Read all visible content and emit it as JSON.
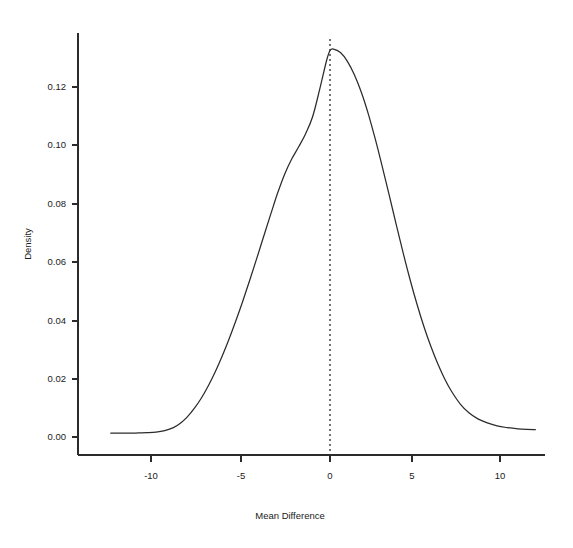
{
  "chart_data": {
    "type": "line",
    "title": "",
    "subtitle": "",
    "xlabel": "Mean Difference",
    "ylabel": "Density",
    "xlim": [
      -12.6,
      11.8
    ],
    "ylim": [
      0.0,
      0.138
    ],
    "grid": false,
    "legend": "none",
    "annotations": [
      {
        "kind": "vertical-reference-line",
        "style": "dotted",
        "x": 0,
        "label": ""
      }
    ],
    "xticks": [
      -10,
      -5,
      0,
      5,
      10
    ],
    "xticklabels": [
      "-10",
      "-5",
      "0",
      "5",
      "10"
    ],
    "yticks": [
      0.0,
      0.02,
      0.04,
      0.06,
      0.08,
      0.1,
      0.12
    ],
    "yticklabels": [
      "0.00",
      "0.02",
      "0.04",
      "0.06",
      "0.08",
      "0.10",
      "0.12"
    ],
    "series": [
      {
        "name": "Density",
        "x": [
          -12.6,
          -12.0,
          -11.5,
          -11.0,
          -10.5,
          -10.0,
          -9.5,
          -9.0,
          -8.6,
          -8.2,
          -7.8,
          -7.4,
          -7.0,
          -6.6,
          -6.2,
          -5.8,
          -5.4,
          -5.0,
          -4.6,
          -4.2,
          -3.8,
          -3.4,
          -3.0,
          -2.6,
          -2.2,
          -1.8,
          -1.4,
          -1.0,
          -0.6,
          -0.2,
          0.0,
          0.2,
          0.6,
          1.0,
          1.4,
          1.8,
          2.2,
          2.6,
          3.0,
          3.4,
          3.8,
          4.2,
          4.6,
          5.0,
          5.4,
          5.8,
          6.2,
          6.6,
          7.0,
          7.5,
          8.0,
          8.5,
          9.0,
          9.6,
          10.2,
          10.8,
          11.3,
          11.8
        ],
        "y": [
          0.0013,
          0.0013,
          0.0013,
          0.0014,
          0.0015,
          0.0017,
          0.0022,
          0.0032,
          0.0047,
          0.0069,
          0.0098,
          0.0133,
          0.0175,
          0.0223,
          0.0277,
          0.0336,
          0.04,
          0.0468,
          0.054,
          0.0614,
          0.069,
          0.0765,
          0.0838,
          0.0902,
          0.0953,
          0.0995,
          0.104,
          0.1098,
          0.119,
          0.129,
          0.1325,
          0.133,
          0.1318,
          0.1288,
          0.1242,
          0.1182,
          0.1108,
          0.1022,
          0.0928,
          0.083,
          0.073,
          0.0632,
          0.054,
          0.0455,
          0.0378,
          0.031,
          0.025,
          0.0198,
          0.0155,
          0.0112,
          0.0082,
          0.0062,
          0.0049,
          0.0038,
          0.0032,
          0.0028,
          0.0026,
          0.0025
        ]
      }
    ]
  },
  "axis": {
    "x_label": "Mean Difference",
    "y_label": "Density",
    "x_tick_labels": [
      "-10",
      "-5",
      "0",
      "5",
      "10"
    ],
    "y_tick_labels": [
      "0.00",
      "0.02",
      "0.04",
      "0.06",
      "0.08",
      "0.10",
      "0.12"
    ]
  },
  "colors": {
    "curve": "#2b2b2b",
    "axis": "#2b2b2b",
    "reference_line": "#1a1a1a",
    "background": "#ffffff"
  }
}
